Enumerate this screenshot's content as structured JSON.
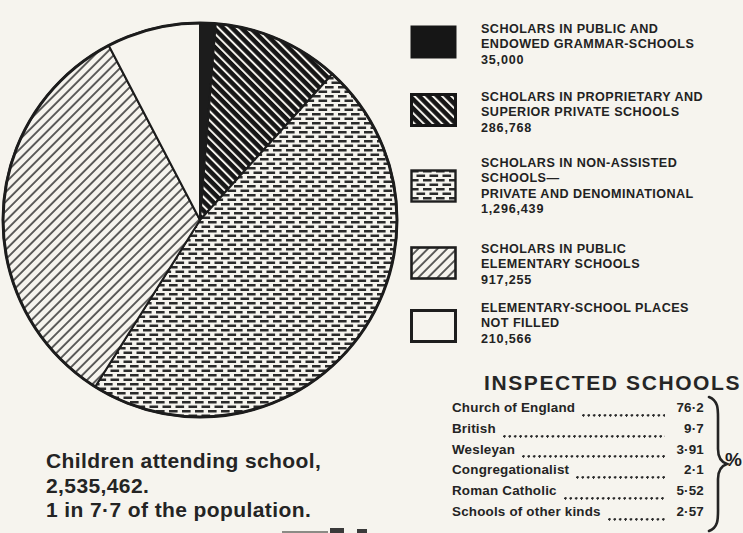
{
  "colors": {
    "ink": "#1c1c1c",
    "paper": "#f6f4ee"
  },
  "chart_data": {
    "type": "pie",
    "title": "Children attending school",
    "start_angle_deg": 0,
    "direction": "clockwise",
    "total": 2746028,
    "slices": [
      {
        "label": "SCHOLARS IN PUBLIC AND ENDOWED GRAMMAR-SCHOOLS",
        "value": 35000,
        "pattern": "solid-black"
      },
      {
        "label": "SCHOLARS IN PROPRIETARY AND SUPERIOR PRIVATE SCHOOLS",
        "value": 286768,
        "pattern": "white-diagonal-on-black"
      },
      {
        "label": "SCHOLARS IN NON-ASSISTED SCHOOLS— PRIVATE AND DENOMINATIONAL",
        "value": 1296439,
        "pattern": "horizontal-dashes"
      },
      {
        "label": "SCHOLARS IN PUBLIC ELEMENTARY SCHOOLS",
        "value": 917255,
        "pattern": "thin-diagonal"
      },
      {
        "label": "ELEMENTARY-SCHOOL PLACES NOT FILLED",
        "value": 210566,
        "pattern": "white"
      }
    ]
  },
  "legend": {
    "items": [
      {
        "swatch": "solid-black",
        "lines": [
          "SCHOLARS IN PUBLIC AND",
          "ENDOWED GRAMMAR-SCHOOLS"
        ],
        "value": "35,000"
      },
      {
        "swatch": "white-diagonal-on-black",
        "lines": [
          "SCHOLARS IN PROPRIETARY AND",
          "SUPERIOR PRIVATE SCHOOLS"
        ],
        "value": "286,768"
      },
      {
        "swatch": "horizontal-dashes",
        "lines": [
          "SCHOLARS IN NON-ASSISTED",
          "SCHOOLS—",
          "PRIVATE AND DENOMINATIONAL"
        ],
        "value": "1,296,439"
      },
      {
        "swatch": "thin-diagonal",
        "lines": [
          "SCHOLARS IN PUBLIC",
          "ELEMENTARY SCHOOLS"
        ],
        "value": "917,255"
      },
      {
        "swatch": "white",
        "lines": [
          "ELEMENTARY-SCHOOL PLACES",
          "NOT FILLED"
        ],
        "value": "210,566"
      }
    ]
  },
  "caption": {
    "lines": [
      "Children attending school,",
      "2,535,462.",
      "1 in 7·7 of the population."
    ]
  },
  "inspected": {
    "title": "INSPECTED SCHOOLS",
    "unit": "%",
    "rows": [
      {
        "name": "Church of England",
        "value": "76·2"
      },
      {
        "name": "British",
        "value": "9·7"
      },
      {
        "name": "Wesleyan",
        "value": "3·91"
      },
      {
        "name": "Congregationalist",
        "value": "2·1"
      },
      {
        "name": "Roman Catholic",
        "value": "5·52"
      },
      {
        "name": "Schools of other kinds",
        "value": "2·57"
      }
    ]
  }
}
